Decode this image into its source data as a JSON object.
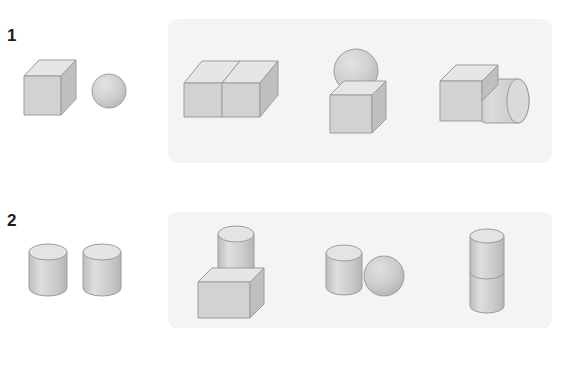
{
  "page": {
    "background_color": "#ffffff",
    "panel_color": "#f4f4f4",
    "text_color": "#1a1a1a",
    "shape_fill_top": "#e2e2e2",
    "shape_fill_front": "#cfcfcf",
    "shape_fill_side": "#bdbdbd",
    "shape_stroke": "#9a9a9a"
  },
  "rows": [
    {
      "number": "1",
      "prompt": {
        "label": "cube and sphere",
        "shapes": [
          "cube",
          "sphere"
        ]
      },
      "options": [
        {
          "label": "two cubes side by side",
          "shapes": [
            "cube",
            "cube"
          ]
        },
        {
          "label": "sphere on top of cube",
          "shapes": [
            "sphere",
            "cube"
          ]
        },
        {
          "label": "cube with cylinder attached",
          "shapes": [
            "cube",
            "cylinder"
          ]
        }
      ]
    },
    {
      "number": "2",
      "prompt": {
        "label": "two cylinders",
        "shapes": [
          "cylinder",
          "cylinder"
        ]
      },
      "options": [
        {
          "label": "cylinder on top of cube",
          "shapes": [
            "cylinder",
            "cube"
          ]
        },
        {
          "label": "cylinder beside sphere",
          "shapes": [
            "cylinder",
            "sphere"
          ]
        },
        {
          "label": "two stacked cylinders",
          "shapes": [
            "cylinder",
            "cylinder"
          ]
        }
      ]
    }
  ]
}
